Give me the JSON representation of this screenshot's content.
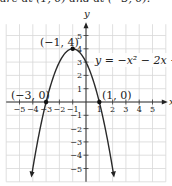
{
  "top_text": "are at (1, 0) and at (−3, 0).",
  "chart_data": {
    "type": "line",
    "title": "",
    "equation_label": "y = −x² − 2x +",
    "xlabel": "x",
    "ylabel": "y",
    "xlim": [
      -6,
      6
    ],
    "ylim": [
      -6,
      6
    ],
    "grid": true,
    "x_ticks": [
      -5,
      -4,
      -3,
      -2,
      -1,
      1,
      2,
      3,
      4,
      5
    ],
    "y_ticks": [
      -5,
      -4,
      -3,
      -2,
      -1,
      1,
      2,
      3,
      4,
      5
    ],
    "series": [
      {
        "name": "y = -x^2 - 2x + 3",
        "x": [
          -4.0,
          -3.5,
          -3.0,
          -2.5,
          -2.0,
          -1.5,
          -1.0,
          -0.5,
          0.0,
          0.5,
          1.0,
          1.5,
          2.0
        ],
        "y": [
          -5.0,
          -2.25,
          0.0,
          1.75,
          3.0,
          3.75,
          4.0,
          3.75,
          3.0,
          1.75,
          0.0,
          -2.25,
          -5.0
        ]
      }
    ],
    "annotations": [
      {
        "label": "(−1, 4)",
        "x": -1,
        "y": 4,
        "type": "vertex"
      },
      {
        "label": "(−3, 0)",
        "x": -3,
        "y": 0,
        "type": "x-intercept"
      },
      {
        "label": "(1, 0)",
        "x": 1,
        "y": 0,
        "type": "x-intercept"
      }
    ]
  },
  "labels": {
    "vertex": "(−1, 4)",
    "left_intercept": "(−3, 0)",
    "right_intercept": "(1, 0)",
    "equation": "y = −x² − 2x +",
    "y_axis": "y",
    "x_axis": "x"
  }
}
